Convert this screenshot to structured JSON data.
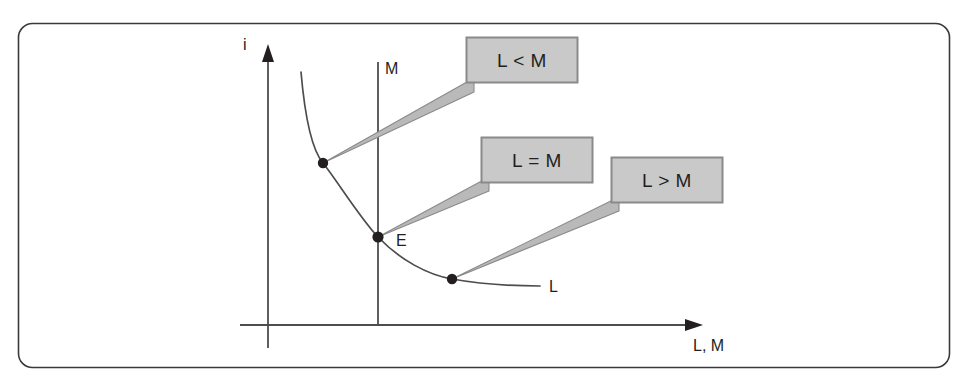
{
  "figure": {
    "type": "economics-diagram",
    "frame": {
      "border_color": "#3a3a3a",
      "fill_color": "#ffffff",
      "corner_radius": 14
    },
    "caption_clipped": "",
    "axes": {
      "y_label": "i",
      "x_label": "L, M",
      "axis_color": "#4d4d4d"
    },
    "lines": [
      {
        "name": "money-supply-line",
        "label": "M",
        "orientation": "vertical",
        "color": "#4d4d4d"
      },
      {
        "name": "money-demand-curve",
        "label": "L",
        "shape": "downward-sloping-convex",
        "color": "#4d4d4d"
      }
    ],
    "points": [
      {
        "name": "point-excess-demand",
        "label": "",
        "region": "L < M"
      },
      {
        "name": "point-equilibrium",
        "label": "E",
        "region": "L = M"
      },
      {
        "name": "point-excess-supply",
        "label": "",
        "region": "L > M"
      }
    ],
    "callouts": [
      {
        "name": "callout-l-less-than-m",
        "text": "L < M"
      },
      {
        "name": "callout-l-equals-m",
        "text": "L = M"
      },
      {
        "name": "callout-l-greater-than-m",
        "text": "L > M"
      }
    ],
    "colors": {
      "callout_fill": "#c9c9c9",
      "callout_border": "#8a8a8a",
      "callout_tail": "#b9b9b9",
      "ink": "#231f20",
      "line": "#4d4d4d"
    }
  }
}
